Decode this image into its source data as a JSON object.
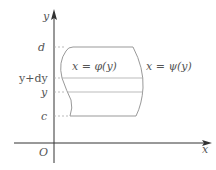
{
  "diagram": {
    "axes": {
      "x_label": "x",
      "y_label": "y",
      "origin_label": "O"
    },
    "y_ticks": [
      {
        "label": "d",
        "y": 47
      },
      {
        "label": "y+dy",
        "y": 78
      },
      {
        "label": "y",
        "y": 92
      },
      {
        "label": "c",
        "y": 116
      }
    ],
    "curves": {
      "left": "x = φ(y)",
      "right": "x = ψ(y)"
    },
    "colors": {
      "axis": "#333333",
      "region": "#999999",
      "dashed": "#aaaaaa",
      "text": "#555555"
    }
  }
}
